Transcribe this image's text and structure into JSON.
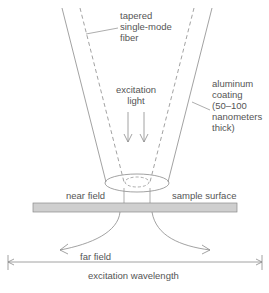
{
  "labels": {
    "fiber": [
      "tapered",
      "single-mode",
      "fiber"
    ],
    "excitation_light": [
      "excitation",
      "light"
    ],
    "coating": [
      "aluminum",
      "coating",
      "(50–100",
      "nanometers",
      "thick)"
    ],
    "near_field": "near field",
    "sample_surface": "sample surface",
    "far_field": "far field",
    "wavelength": "excitation wavelength"
  },
  "colors": {
    "line": "#8a8a8a",
    "sample": "#cfcfcf",
    "sample_border": "#8a8a8a",
    "text": "#555555"
  }
}
